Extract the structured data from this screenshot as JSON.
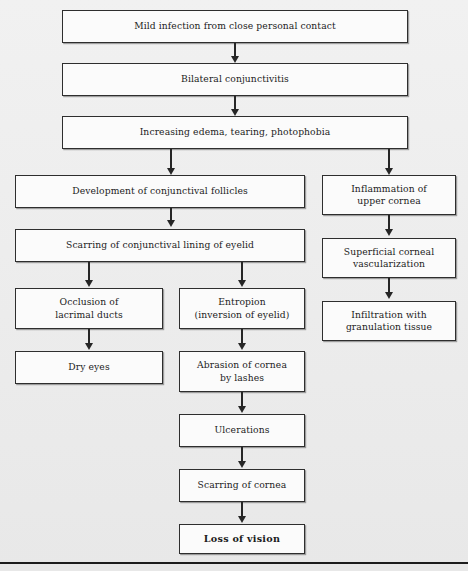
{
  "figure": {
    "background_color": "#ececec",
    "box_fill": "#fbfbfb",
    "line_color": "#262626",
    "footer_rule": true
  },
  "nodes": {
    "n1": {
      "label": "Mild infection from close personal contact"
    },
    "n2": {
      "label": "Bilateral conjunctivitis"
    },
    "n3": {
      "label": "Increasing edema, tearing, photophobia"
    },
    "n4": {
      "label": "Development of conjunctival follicles"
    },
    "n5": {
      "label": "Inflammation of\nupper cornea"
    },
    "n6": {
      "label": "Scarring of conjunctival lining of eyelid"
    },
    "n7": {
      "label": "Superficial corneal\nvascularization"
    },
    "n8": {
      "label": "Occlusion of\nlacrimal ducts"
    },
    "n9": {
      "label": "Entropion\n(inversion of eyelid)"
    },
    "n10": {
      "label": "Infiltration with\ngranulation tissue"
    },
    "n11": {
      "label": "Dry eyes"
    },
    "n12": {
      "label": "Abrasion of cornea\nby lashes"
    },
    "n13": {
      "label": "Ulcerations"
    },
    "n14": {
      "label": "Scarring of cornea"
    },
    "n15": {
      "label": "Loss of vision"
    }
  },
  "edges": [
    {
      "from": "n1",
      "to": "n2"
    },
    {
      "from": "n2",
      "to": "n3"
    },
    {
      "from": "n3",
      "to": "n4"
    },
    {
      "from": "n3",
      "to": "n5"
    },
    {
      "from": "n4",
      "to": "n6"
    },
    {
      "from": "n5",
      "to": "n7"
    },
    {
      "from": "n6",
      "to": "n8"
    },
    {
      "from": "n6",
      "to": "n9"
    },
    {
      "from": "n7",
      "to": "n10"
    },
    {
      "from": "n8",
      "to": "n11"
    },
    {
      "from": "n9",
      "to": "n12"
    },
    {
      "from": "n12",
      "to": "n13"
    },
    {
      "from": "n13",
      "to": "n14"
    },
    {
      "from": "n14",
      "to": "n15"
    }
  ]
}
